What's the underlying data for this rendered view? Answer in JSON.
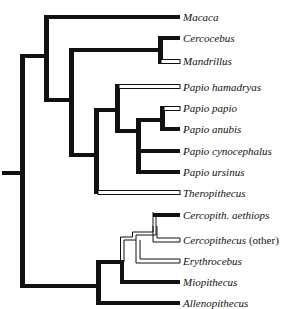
{
  "figure": {
    "type": "phylogenetic-tree",
    "legend_semantics": {
      "thick_black_branch": "#111111",
      "open_white_branch": "#ffffff"
    }
  },
  "taxa": [
    {
      "name": "Macaca",
      "suffix": "",
      "y": 18
    },
    {
      "name": "Cercocebus",
      "suffix": "",
      "y": 41
    },
    {
      "name": "Mandrillus",
      "suffix": "",
      "y": 60
    },
    {
      "name": "Papio hamadryas",
      "suffix": "",
      "y": 87
    },
    {
      "name": "Papio papio",
      "suffix": "",
      "y": 110
    },
    {
      "name": "Papio anubis",
      "suffix": "",
      "y": 130
    },
    {
      "name": "Papio cynocephalus",
      "suffix": "",
      "y": 151
    },
    {
      "name": "Papio ursinus",
      "suffix": "",
      "y": 173
    },
    {
      "name": "Theropithecus",
      "suffix": "",
      "y": 194
    },
    {
      "name": "Cercopith. aethiops",
      "suffix": "",
      "y": 217
    },
    {
      "name": "Cercopithecus",
      "suffix": "(other)",
      "y": 240
    },
    {
      "name": "Erythrocebus",
      "suffix": "",
      "y": 261
    },
    {
      "name": "Miopithecus",
      "suffix": "",
      "y": 282
    },
    {
      "name": "Allenopithecus",
      "suffix": "",
      "y": 303
    }
  ],
  "branches": {
    "filled": [
      {
        "x1": 2,
        "y1": 173,
        "x2": 24,
        "y2": 173
      },
      {
        "x1": 24,
        "y1": 56,
        "x2": 24,
        "y2": 286
      },
      {
        "x1": 24,
        "y1": 56,
        "x2": 48,
        "y2": 56
      },
      {
        "x1": 48,
        "y1": 17,
        "x2": 48,
        "y2": 100
      },
      {
        "x1": 48,
        "y1": 17,
        "x2": 180,
        "y2": 17
      },
      {
        "x1": 48,
        "y1": 100,
        "x2": 72,
        "y2": 100
      },
      {
        "x1": 72,
        "y1": 50,
        "x2": 72,
        "y2": 155
      },
      {
        "x1": 72,
        "y1": 50,
        "x2": 160,
        "y2": 50
      },
      {
        "x1": 160,
        "y1": 38,
        "x2": 160,
        "y2": 62
      },
      {
        "x1": 160,
        "y1": 38,
        "x2": 180,
        "y2": 38
      },
      {
        "x1": 72,
        "y1": 155,
        "x2": 96,
        "y2": 155
      },
      {
        "x1": 96,
        "y1": 110,
        "x2": 96,
        "y2": 190
      },
      {
        "x1": 96,
        "y1": 110,
        "x2": 117,
        "y2": 110
      },
      {
        "x1": 117,
        "y1": 84,
        "x2": 117,
        "y2": 131
      },
      {
        "x1": 117,
        "y1": 131,
        "x2": 138,
        "y2": 131
      },
      {
        "x1": 138,
        "y1": 120,
        "x2": 138,
        "y2": 172
      },
      {
        "x1": 138,
        "y1": 120,
        "x2": 162,
        "y2": 120
      },
      {
        "x1": 162,
        "y1": 106,
        "x2": 162,
        "y2": 129
      },
      {
        "x1": 162,
        "y1": 129,
        "x2": 180,
        "y2": 129
      },
      {
        "x1": 138,
        "y1": 151,
        "x2": 180,
        "y2": 151
      },
      {
        "x1": 138,
        "y1": 172,
        "x2": 180,
        "y2": 172
      },
      {
        "x1": 24,
        "y1": 286,
        "x2": 98,
        "y2": 286
      },
      {
        "x1": 98,
        "y1": 262,
        "x2": 98,
        "y2": 303
      },
      {
        "x1": 98,
        "y1": 303,
        "x2": 180,
        "y2": 303
      },
      {
        "x1": 98,
        "y1": 262,
        "x2": 122,
        "y2": 262
      },
      {
        "x1": 122,
        "y1": 262,
        "x2": 122,
        "y2": 282
      },
      {
        "x1": 122,
        "y1": 282,
        "x2": 180,
        "y2": 282
      },
      {
        "x1": 156,
        "y1": 215,
        "x2": 180,
        "y2": 215
      }
    ],
    "open": [
      {
        "x1": 160,
        "y1": 62,
        "x2": 180,
        "y2": 62
      },
      {
        "x1": 117,
        "y1": 87,
        "x2": 180,
        "y2": 87
      },
      {
        "x1": 162,
        "y1": 108,
        "x2": 180,
        "y2": 108
      },
      {
        "x1": 96,
        "y1": 192,
        "x2": 180,
        "y2": 192
      }
    ],
    "thin": [
      {
        "x1": 122,
        "y1": 262,
        "x2": 122,
        "y2": 238
      },
      {
        "x1": 122,
        "y1": 238,
        "x2": 133,
        "y2": 238
      },
      {
        "x1": 122,
        "y1": 238,
        "x2": 152,
        "y2": 238
      },
      {
        "x1": 133,
        "y1": 238,
        "x2": 133,
        "y2": 246
      },
      {
        "x1": 133,
        "y1": 246,
        "x2": 180,
        "y2": 246
      },
      {
        "x1": 133,
        "y1": 226,
        "x2": 133,
        "y2": 238
      },
      {
        "x1": 133,
        "y1": 226,
        "x2": 153,
        "y2": 226
      },
      {
        "x1": 153,
        "y1": 215,
        "x2": 153,
        "y2": 238
      },
      {
        "x1": 153,
        "y1": 238,
        "x2": 180,
        "y2": 238
      }
    ]
  },
  "colors": {
    "background": "#ffffff",
    "branch": "#111111",
    "text": "#111111"
  }
}
